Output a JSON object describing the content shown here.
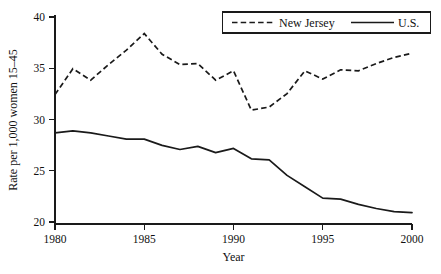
{
  "chart_data": {
    "type": "line",
    "title": "",
    "xlabel": "Year",
    "ylabel": "Rate per 1,000 women 15–45",
    "xlim": [
      1980,
      2000
    ],
    "ylim": [
      20,
      40
    ],
    "grid": false,
    "legend_position": "top-right",
    "x": [
      1980,
      1981,
      1982,
      1983,
      1984,
      1985,
      1986,
      1987,
      1988,
      1989,
      1990,
      1991,
      1992,
      1993,
      1994,
      1995,
      1996,
      1997,
      1998,
      1999,
      2000
    ],
    "xticks": [
      "1980",
      "1985",
      "1990",
      "1995",
      "2000"
    ],
    "xtick_values": [
      1980,
      1985,
      1990,
      1995,
      2000
    ],
    "yticks": [
      "20",
      "25",
      "30",
      "35",
      "40"
    ],
    "ytick_values": [
      20,
      25,
      30,
      35,
      40
    ],
    "series": [
      {
        "name": "New Jersey",
        "style": "dashed",
        "color": "#1a1a1a",
        "values": [
          32.5,
          35.0,
          33.9,
          35.4,
          36.8,
          38.4,
          36.4,
          35.4,
          35.5,
          33.9,
          34.8,
          31.0,
          31.3,
          32.6,
          34.8,
          34.0,
          34.9,
          34.8,
          35.5,
          36.1,
          36.5
        ]
      },
      {
        "name": "U.S.",
        "style": "solid",
        "color": "#1a1a1a",
        "values": [
          28.8,
          29.0,
          28.8,
          28.5,
          28.2,
          28.2,
          27.6,
          27.2,
          27.5,
          26.9,
          27.3,
          26.3,
          26.2,
          24.7,
          23.6,
          22.5,
          22.4,
          21.9,
          21.5,
          21.2,
          21.1
        ]
      }
    ]
  },
  "legend": {
    "entries": [
      {
        "label": "New Jersey",
        "style": "dashed"
      },
      {
        "label": "U.S.",
        "style": "solid"
      }
    ]
  },
  "axes": {
    "x_title": "Year",
    "y_title": "Rate per 1,000 women 15–45"
  },
  "footer": {
    "caption_fragment": ""
  }
}
